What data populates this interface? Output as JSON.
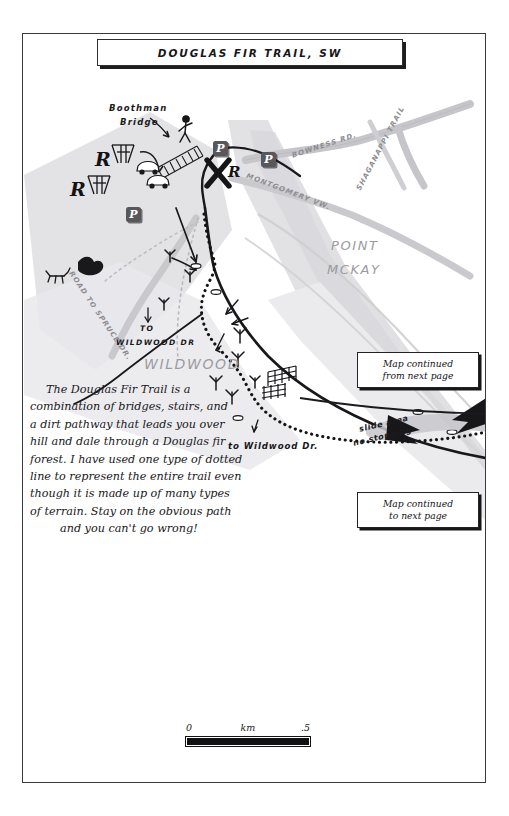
{
  "document": {
    "title": "DOUGLAS FIR TRAIL, SW",
    "type": "hand-drawn trail map"
  },
  "labels": {
    "boothman_bridge": "Boothman\nBridge",
    "boothman_bridge_line1": "Boothman",
    "boothman_bridge_line2": "Bridge",
    "bowness_rd": "BOWNESS RD.",
    "shaganappi_trail": "SHAGANAPPI TRAIL",
    "montgomery_vw": "MONTGOMERY VW.",
    "road_to_spruce_dr": "ROAD TO SPRUCE DR.",
    "point_mckay_line1": "POINT",
    "point_mckay_line2": "MCKAY",
    "wildwood_area": "WILDWOOD",
    "to_wildwood_dr_line1": "TO",
    "to_wildwood_dr_line2": "WILDWOOD DR",
    "to_wildwood_dr_lower": "to Wildwood Dr.",
    "slide_area_line1": "slide area",
    "slide_area_line2": "no stopping",
    "parking_symbol": "P",
    "restroom_symbol": "R"
  },
  "description": {
    "lines": [
      "The Douglas Fir Trail is a",
      "combination of bridges, stairs, and",
      "a dirt pathway that leads you over",
      "hill and dale through a Douglas fir",
      "forest. I have used one type of dotted",
      "line to represent the entire trail even",
      "though it is made up of many types",
      "of terrain. Stay on the obvious path",
      "and you can't go wrong!"
    ],
    "full_text": "The Douglas Fir Trail is a combination of bridges, stairs, and a dirt pathway that leads you over hill and dale through a Douglas fir forest. I have used one type of dotted line to represent the entire trail even though it is made up of many types of terrain. Stay on the obvious path and you can't go wrong!"
  },
  "continued_boxes": {
    "from_next_page": {
      "line1": "Map continued",
      "line2": "from next page"
    },
    "to_next_page": {
      "line1": "Map continued",
      "line2": "to next page"
    }
  },
  "scale": {
    "start": "0",
    "unit": "km",
    "end": ".5"
  },
  "colors": {
    "ink": "#17171a",
    "road_grey": "#c9c9cc",
    "land_grey": "#dcdcdf",
    "label_grey": "#9b9b9f",
    "parking_fill": "#58585c",
    "paper": "#ffffff"
  }
}
